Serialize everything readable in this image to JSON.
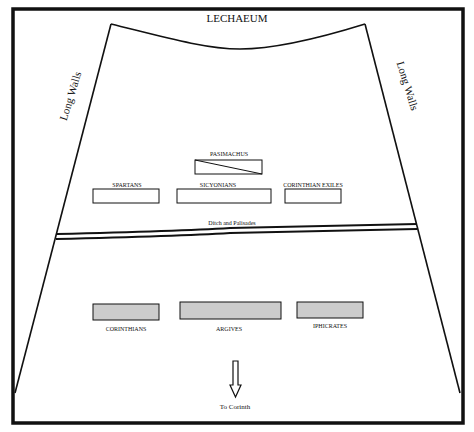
{
  "title": "LECHAEUM",
  "walls": {
    "left_label": "Long Walls",
    "right_label": "Long Walls"
  },
  "ditch": {
    "label": "Ditch and Palisades"
  },
  "upper_units": [
    {
      "id": "pasimachus",
      "label": "PASIMACHUS",
      "fill": "#ffffff",
      "diagonal": true
    },
    {
      "id": "spartans",
      "label": "SPARTANS",
      "fill": "#ffffff"
    },
    {
      "id": "sicyonians",
      "label": "SICYONIANS",
      "fill": "#ffffff"
    },
    {
      "id": "corinthian-exiles",
      "label": "CORINTHIAN  EXILES",
      "fill": "#ffffff"
    }
  ],
  "lower_units": [
    {
      "id": "corinthians",
      "label": "CORINTHIANS",
      "fill": "#cccccc"
    },
    {
      "id": "argives",
      "label": "ARGIVES",
      "fill": "#cccccc"
    },
    {
      "id": "iphicrates",
      "label": "IPHICRATES",
      "fill": "#cccccc"
    }
  ],
  "direction": {
    "label": "To Corinth",
    "icon": "down-arrow-icon"
  },
  "colors": {
    "stroke": "#111111",
    "friendly_fill": "#ffffff",
    "enemy_fill": "#cccccc",
    "background": "#ffffff"
  }
}
